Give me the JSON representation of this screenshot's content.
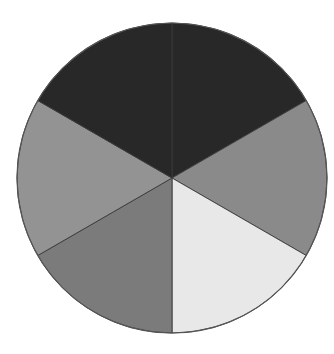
{
  "chart_data": {
    "type": "pie",
    "title": "",
    "legend": [],
    "start_angle_deg": 0,
    "direction": "clockwise",
    "center": [
      172,
      178
    ],
    "radius": 155,
    "slices": [
      {
        "label": "",
        "value": 16.67,
        "color": "#282828"
      },
      {
        "label": "",
        "value": 16.67,
        "color": "#8a8a8a"
      },
      {
        "label": "",
        "value": 16.67,
        "color": "#e8e8e8"
      },
      {
        "label": "",
        "value": 16.67,
        "color": "#7b7b7b"
      },
      {
        "label": "",
        "value": 16.67,
        "color": "#939393"
      },
      {
        "label": "",
        "value": 16.67,
        "color": "#282828"
      }
    ]
  }
}
